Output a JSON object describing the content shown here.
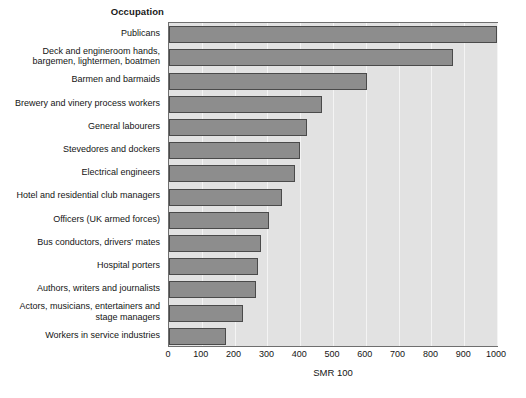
{
  "chart_data": {
    "type": "bar",
    "orientation": "horizontal",
    "title": "",
    "category_axis_title": "Occupation",
    "xlabel": "SMR 100",
    "ylabel": "",
    "xlim": [
      0,
      1000
    ],
    "xticks": [
      0,
      100,
      200,
      300,
      400,
      500,
      600,
      700,
      800,
      900,
      1000
    ],
    "grid": true,
    "legend": null,
    "categories": [
      "Publicans",
      "Deck and engineroom hands,\nbargemen, lightermen, boatmen",
      "Barmen and barmaids",
      "Brewery and vinery process workers",
      "General labourers",
      "Stevedores and dockers",
      "Electrical engineers",
      "Hotel and residential club managers",
      "Officers (UK armed forces)",
      "Bus conductors, drivers' mates",
      "Hospital porters",
      "Authors, writers and journalists",
      "Actors, musicians, entertainers and\nstage managers",
      "Workers in service industries"
    ],
    "values": [
      1000,
      865,
      605,
      465,
      420,
      400,
      385,
      345,
      305,
      280,
      270,
      265,
      225,
      175
    ],
    "bar_color": "#8d8d8d",
    "bar_edge_color": "#4a4a4a",
    "plot_background": "#e2e2e2",
    "gridline_color": "#f4f4f4"
  }
}
